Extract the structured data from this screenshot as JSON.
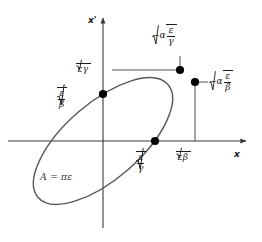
{
  "figure": {
    "kind": "phase-space-ellipse-diagram",
    "background": "#ffffff",
    "stroke_color": "#555555",
    "axis_color": "#3a3a3a",
    "marker_color": "#000000",
    "width": 262,
    "height": 242
  },
  "axes": {
    "x_label": "x",
    "y_label": "x'",
    "origin": {
      "x": 103,
      "y": 141
    },
    "x_axis_from": {
      "x": 8,
      "y": 141
    },
    "x_axis_to": {
      "x": 250,
      "y": 141
    },
    "y_axis_from": {
      "x": 103,
      "y": 228
    },
    "y_axis_to": {
      "x": 103,
      "y": 14
    }
  },
  "ellipse": {
    "center": {
      "x": 103,
      "y": 141
    },
    "semi_major": 86,
    "semi_minor": 38,
    "rotation_deg": -41,
    "area_label": {
      "prefix": "A",
      "equals": "=",
      "pi": "π",
      "epsilon": "ε",
      "full_text": "A = πε"
    }
  },
  "symbols": {
    "alpha": "α",
    "beta": "β",
    "gamma": "γ",
    "epsilon": "ε",
    "minus": "−",
    "radical": "√"
  },
  "markers": [
    {
      "name": "top-tangent-point",
      "x": 180,
      "y": 70,
      "label_id": "label_top_right"
    },
    {
      "name": "right-extreme-point",
      "x": 195,
      "y": 82,
      "label_id": "label_right"
    },
    {
      "name": "y-axis-intercept",
      "x": 103,
      "y": 94,
      "label_id": "label_left"
    },
    {
      "name": "x-axis-intercept",
      "x": 155,
      "y": 141,
      "label_id": "label_bottom"
    }
  ],
  "labels": {
    "label_top_right": {
      "id": "label_top_right",
      "text": "−α√(ε/γ)",
      "coefficient": "−α",
      "numerator": "ε",
      "denominator": "γ",
      "style": "fraction-under-radical"
    },
    "label_right": {
      "id": "label_right",
      "text": "−α√(ε/β)",
      "coefficient": "−α",
      "numerator": "ε",
      "denominator": "β",
      "style": "fraction-under-radical"
    },
    "label_sqrt_eps_gamma": {
      "id": "label_sqrt_eps_gamma",
      "text": "√(εγ)",
      "product": "εγ",
      "style": "product-under-radical"
    },
    "label_left": {
      "id": "label_left",
      "text": "√(ε/β)",
      "numerator": "ε",
      "denominator": "β",
      "style": "fraction-under-radical"
    },
    "label_bottom": {
      "id": "label_bottom",
      "text": "√(ε/γ)",
      "numerator": "ε",
      "denominator": "γ",
      "style": "fraction-under-radical"
    },
    "label_sqrt_eps_beta": {
      "id": "label_sqrt_eps_beta",
      "text": "√(εβ)",
      "product": "εβ",
      "style": "product-under-radical"
    }
  },
  "guide_lines": [
    {
      "name": "horizontal-guide-to-top-point",
      "x1": 112,
      "y1": 70,
      "x2": 180,
      "y2": 70
    },
    {
      "name": "vertical-guide-from-top-point",
      "x1": 180,
      "y1": 70,
      "x2": 180,
      "y2": 56
    },
    {
      "name": "horizontal-guide-to-right-point",
      "x1": 195,
      "y1": 82,
      "x2": 208,
      "y2": 82
    },
    {
      "name": "vertical-guide-from-right-point",
      "x1": 195,
      "y1": 82,
      "x2": 195,
      "y2": 141
    }
  ]
}
